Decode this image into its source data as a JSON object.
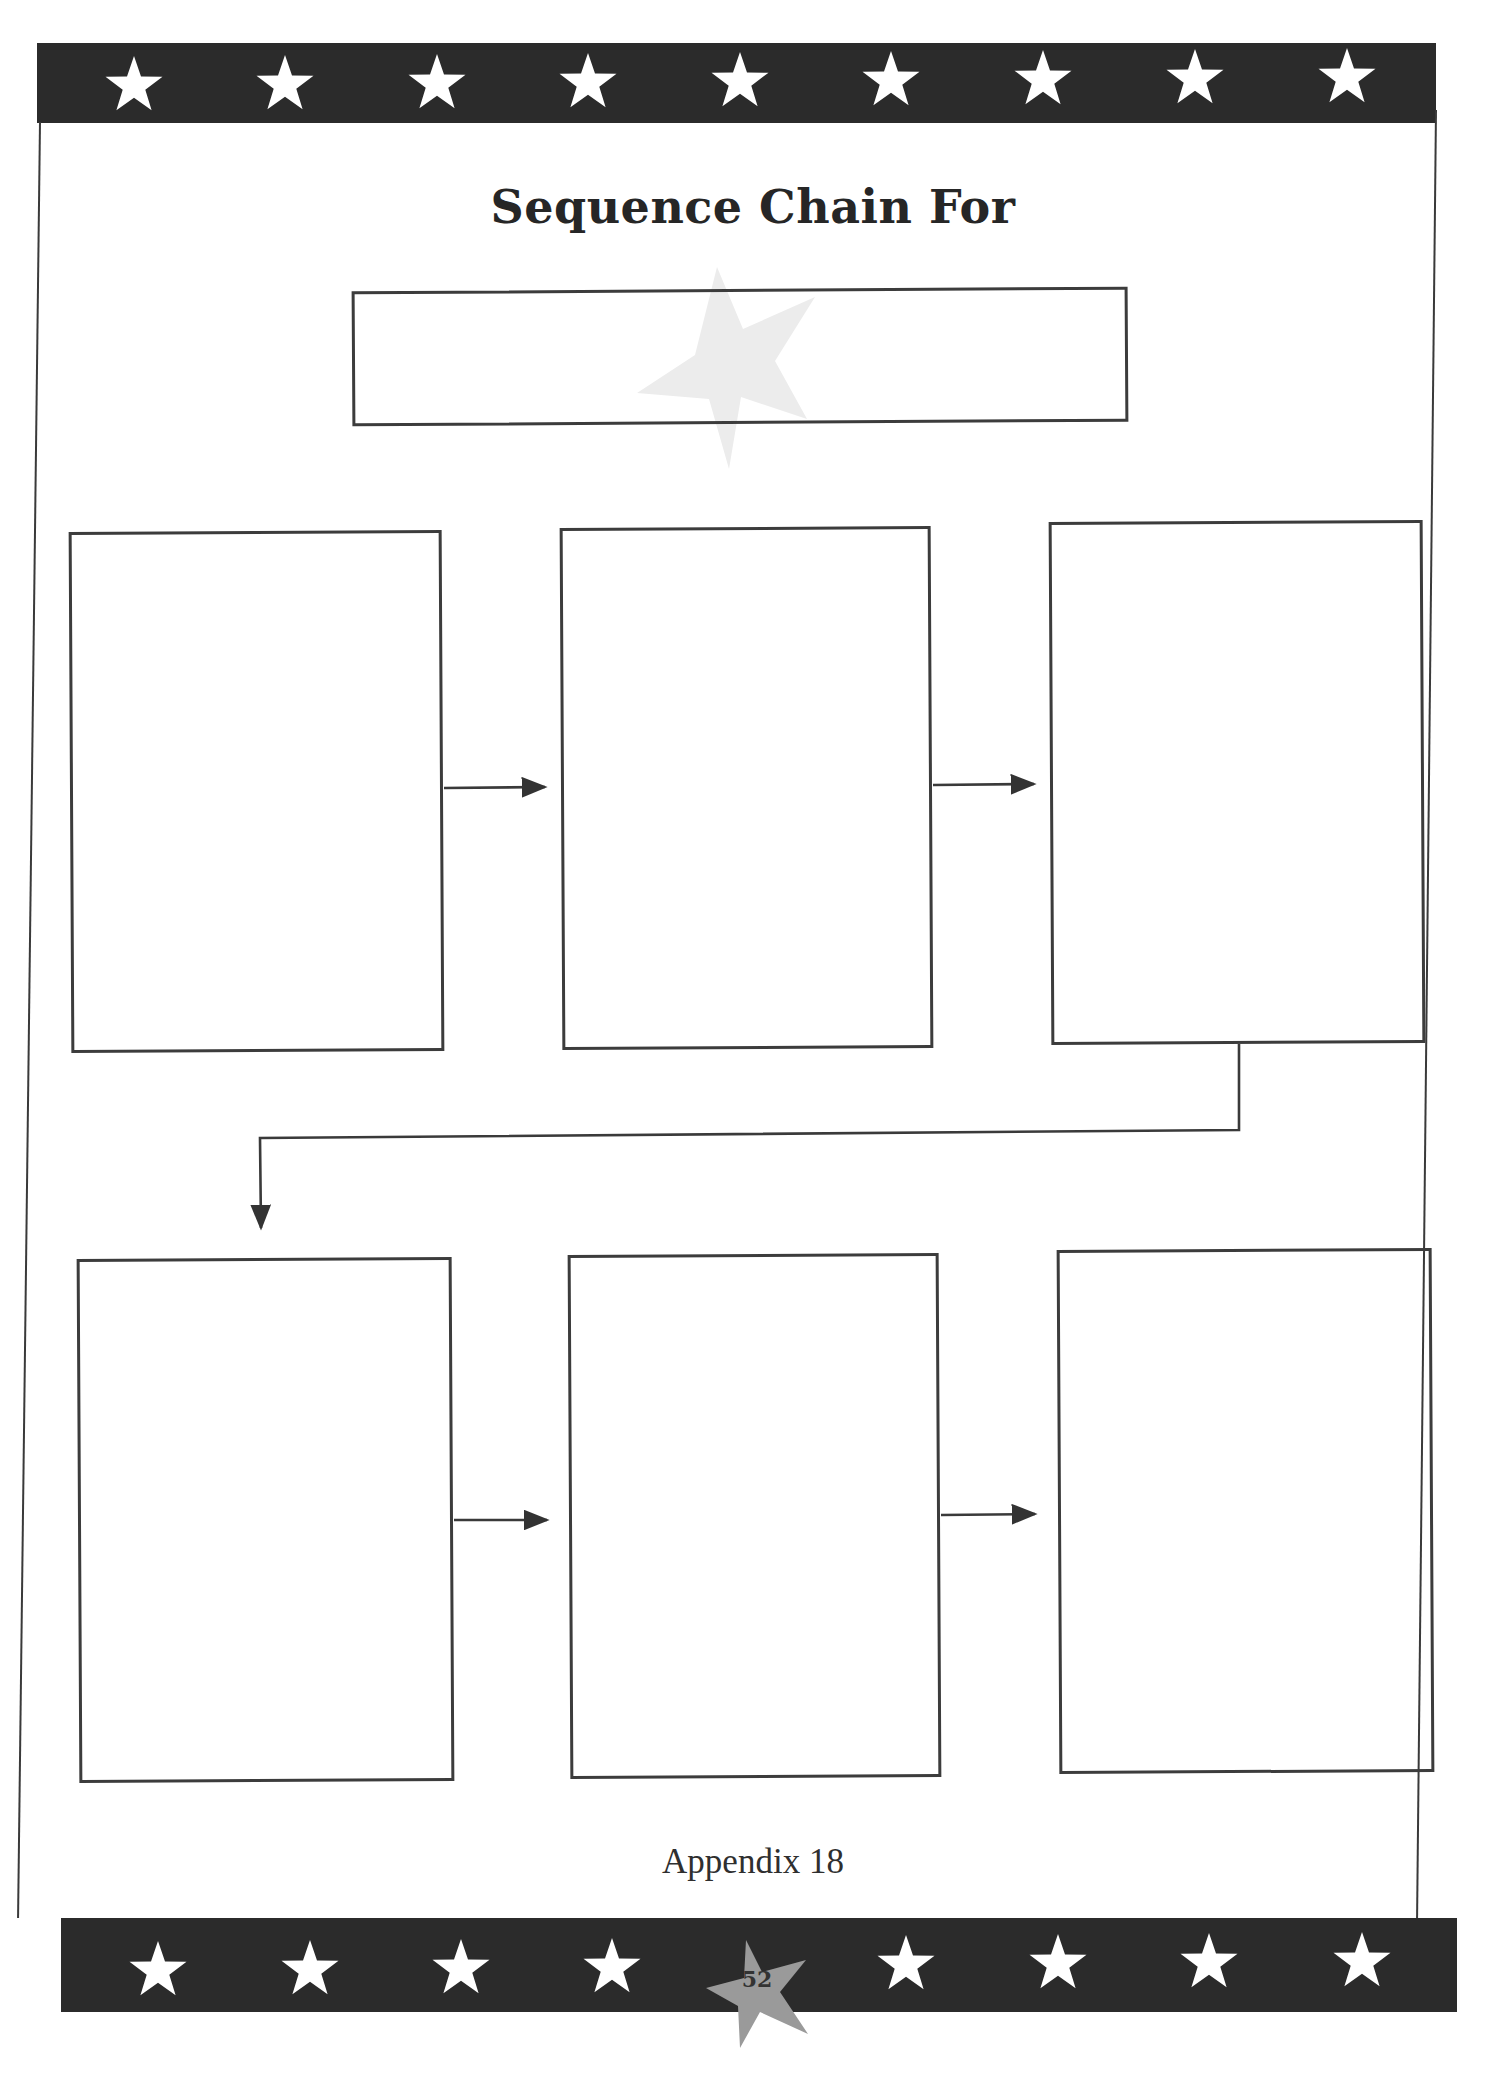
{
  "document": {
    "title": "Sequence Chain For",
    "footer_label": "Appendix 18",
    "page_number": "52"
  },
  "decorations": {
    "top_band_star_count": 9,
    "bottom_band_star_count": 8,
    "band_color": "#2b2b2b",
    "star_color": "#ffffff",
    "page_star_color": "#9a9a9a",
    "watermark_star_color": "#ececec"
  },
  "sequence_chain": {
    "title_field": {
      "value": ""
    },
    "steps": [
      {
        "id": 1,
        "value": ""
      },
      {
        "id": 2,
        "value": ""
      },
      {
        "id": 3,
        "value": ""
      },
      {
        "id": 4,
        "value": ""
      },
      {
        "id": 5,
        "value": ""
      },
      {
        "id": 6,
        "value": ""
      }
    ],
    "arrows": [
      {
        "from": 1,
        "to": 2,
        "direction": "right"
      },
      {
        "from": 2,
        "to": 3,
        "direction": "right"
      },
      {
        "from": 3,
        "to": 4,
        "direction": "down-left-down"
      },
      {
        "from": 4,
        "to": 5,
        "direction": "right"
      },
      {
        "from": 5,
        "to": 6,
        "direction": "right"
      }
    ]
  }
}
